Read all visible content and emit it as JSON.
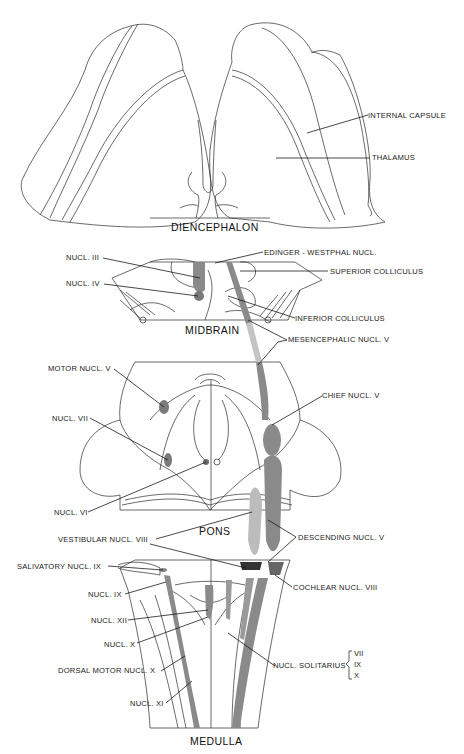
{
  "sections": {
    "diencephalon": "DIENCEPHALON",
    "midbrain": "MIDBRAIN",
    "pons": "PONS",
    "medulla": "MEDULLA"
  },
  "labels": {
    "internal_capsule": "INTERNAL CAPSULE",
    "thalamus": "THALAMUS",
    "nucl_iii": "NUCL. III",
    "edinger_westphal": "EDINGER - WESTPHAL NUCL.",
    "superior_colliculus": "SUPERIOR COLLICULUS",
    "nucl_iv": "NUCL. IV",
    "inferior_colliculus": "INFERIOR COLLICULUS",
    "mesencephalic_nucl_v": "MESENCEPHALIC NUCL. V",
    "motor_nucl_v": "MOTOR NUCL. V",
    "chief_nucl_v": "CHIEF NUCL. V",
    "nucl_vii": "NUCL. VII",
    "nucl_vi": "NUCL. VI",
    "vestibular_nucl_viii": "VESTIBULAR NUCL. VIII",
    "descending_nucl_v": "DESCENDING NUCL. V",
    "salivatory_nucl_ix": "SALIVATORY NUCL. IX",
    "cochlear_nucl_viii": "COCHLEAR NUCL. VIII",
    "nucl_ix": "NUCL. IX",
    "nucl_xii": "NUCL. XII",
    "nucl_x": "NUCL. X",
    "nucl_solitarius": "NUCL. SOLITARIUS",
    "solitarius_nerves": [
      "VII",
      "IX",
      "X"
    ],
    "dorsal_motor_nucl_x": "DORSAL MOTOR NUCL. X",
    "nucl_xi": "NUCL. XI"
  },
  "colors": {
    "line": "#2a2a2a",
    "nucleus_dark": "#7a7a7a",
    "nucleus_light": "#bdbdbd"
  }
}
